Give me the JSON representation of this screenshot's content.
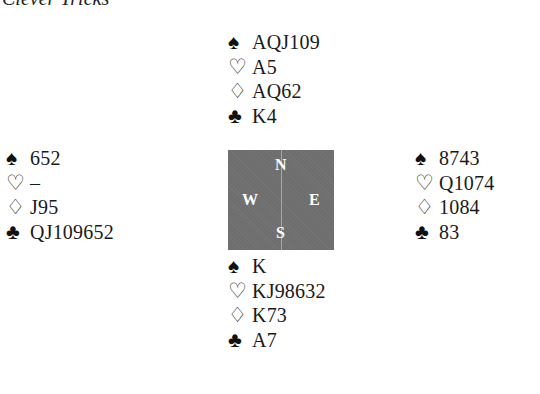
{
  "title": "Clever Tricks",
  "suit_symbols": {
    "spades": "♠",
    "hearts": "♡",
    "diamonds": "♢",
    "clubs": "♣"
  },
  "compass": {
    "north": "N",
    "south": "S",
    "east": "E",
    "west": "W"
  },
  "hands": {
    "north": {
      "spades": "AQJ109",
      "hearts": "A5",
      "diamonds": "AQ62",
      "clubs": "K4"
    },
    "west": {
      "spades": "652",
      "hearts": "–",
      "diamonds": "J95",
      "clubs": "QJ109652"
    },
    "east": {
      "spades": "8743",
      "hearts": "Q1074",
      "diamonds": "1084",
      "clubs": "83"
    },
    "south": {
      "spades": "K",
      "hearts": "KJ98632",
      "diamonds": "K73",
      "clubs": "A7"
    }
  }
}
